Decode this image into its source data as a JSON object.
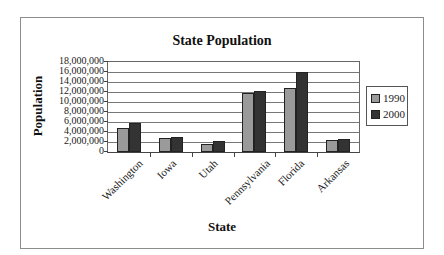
{
  "chart_data": {
    "type": "bar",
    "title": "State Population",
    "xlabel": "State",
    "ylabel": "Population",
    "categories": [
      "Washington",
      "Iowa",
      "Utah",
      "Pennsylvania",
      "Florida",
      "Arkansas"
    ],
    "series": [
      {
        "name": "1990",
        "color": "#9a9a9a",
        "values": [
          4900000,
          2800000,
          1700000,
          11900000,
          12900000,
          2350000
        ]
      },
      {
        "name": "2000",
        "color": "#333333",
        "values": [
          5900000,
          2930000,
          2230000,
          12300000,
          16000000,
          2670000
        ]
      }
    ],
    "ylim": [
      0,
      18000000
    ],
    "yticks": [
      "18,000,000",
      "16,000,000",
      "14,000,000",
      "12,000,000",
      "10,000,000",
      "8,000,000",
      "6,000,000",
      "4,000,000",
      "2,000,000",
      "0"
    ],
    "grid": true,
    "legend_position": "right"
  }
}
